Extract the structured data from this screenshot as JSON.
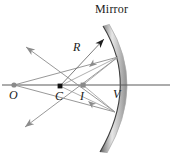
{
  "figure": {
    "width": 172,
    "height": 157,
    "background": "#ffffff",
    "labels": {
      "mirror": "Mirror",
      "radius": "R",
      "object": "O",
      "center": "C",
      "image": "I",
      "vertex": "V"
    },
    "colors": {
      "ray": "#8c8c8c",
      "ray_dark": "#6e6e6e",
      "axis": "#555555",
      "mirror_dark": "#4a4a4a",
      "mirror_light": "#d8d8d8",
      "point_fill": "#8a8a8a",
      "center_fill": "#111111",
      "text": "#1a1a1a"
    },
    "points": {
      "object": {
        "x": 14,
        "y": 85,
        "label": "O"
      },
      "center": {
        "x": 60,
        "y": 86,
        "label": "C"
      },
      "image": {
        "x": 83,
        "y": 85,
        "label": "I"
      },
      "vertex": {
        "x": 127,
        "y": 85,
        "label": "V"
      }
    },
    "axis": {
      "x1": 2,
      "y1": 85,
      "x2": 170,
      "y2": 85
    },
    "mirror_arc": {
      "top": {
        "x": 103,
        "y": 26
      },
      "vertex": {
        "x": 127,
        "y": 85
      },
      "bottom": {
        "x": 100,
        "y": 152
      },
      "thickness": 7
    },
    "radius_arrow": {
      "from_x": 60,
      "from_y": 86,
      "to_x": 104,
      "to_y": 39
    },
    "rays": [
      {
        "name": "incident-upper",
        "from_x": 14,
        "from_y": 85,
        "to_x": 118,
        "to_y": 57
      },
      {
        "name": "incident-lower",
        "from_x": 14,
        "from_y": 85,
        "to_x": 115,
        "to_y": 112
      },
      {
        "name": "reflected-upper",
        "from_x": 118,
        "from_y": 57,
        "to_x": 25,
        "to_y": 127
      },
      {
        "name": "reflected-lower",
        "from_x": 115,
        "from_y": 112,
        "to_x": 26,
        "to_y": 47
      },
      {
        "name": "chord-upper-to-image",
        "from_x": 118,
        "from_y": 57,
        "to_x": 83,
        "to_y": 85
      },
      {
        "name": "chord-lower-to-image",
        "from_x": 115,
        "from_y": 112,
        "to_x": 83,
        "to_y": 85
      },
      {
        "name": "center-to-mirror-upper",
        "from_x": 60,
        "from_y": 86,
        "to_x": 118,
        "to_y": 57
      },
      {
        "name": "center-to-mirror-lower",
        "from_x": 60,
        "from_y": 86,
        "to_x": 115,
        "to_y": 112
      }
    ],
    "arrowheads": [
      {
        "name": "arrow-radius",
        "x": 104,
        "y": 39,
        "angle": -47
      },
      {
        "name": "arrow-reflected-up",
        "x": 26,
        "y": 47,
        "angle": -145
      },
      {
        "name": "arrow-reflected-down",
        "x": 25,
        "y": 127,
        "angle": 143
      },
      {
        "name": "arrow-chord-upper",
        "x": 89,
        "y": 67,
        "angle": 141
      },
      {
        "name": "arrow-chord-lower",
        "x": 88,
        "y": 101,
        "angle": -141
      }
    ]
  }
}
